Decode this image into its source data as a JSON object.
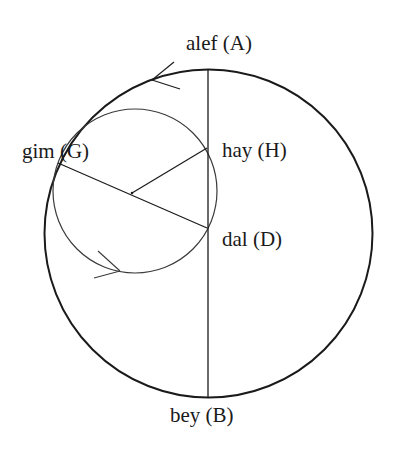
{
  "diagram": {
    "colors": {
      "stroke": "#1a1a1a",
      "inner_stroke": "#3a3a3a",
      "background": "#ffffff"
    },
    "outer_circle": {
      "cx": 208.5,
      "cy": 233.5,
      "r": 164
    },
    "inner_circle": {
      "cx": 135,
      "cy": 191,
      "r": 82
    },
    "points": {
      "A": {
        "name": "alef",
        "label": "alef (A)",
        "x": 208,
        "y": 70
      },
      "B": {
        "name": "bey",
        "label": "bey (B)",
        "x": 208,
        "y": 397
      },
      "G": {
        "name": "gim",
        "label": "gim (G)",
        "x": 58,
        "y": 163
      },
      "D": {
        "name": "dal",
        "label": "dal (D)",
        "x": 207,
        "y": 228
      },
      "H": {
        "name": "hay",
        "label": "hay (H)",
        "x": 207,
        "y": 148
      },
      "center": {
        "x": 132,
        "y": 193
      }
    },
    "segments": [
      "A-B",
      "G-D",
      "center-H"
    ],
    "arrows": [
      {
        "on": "outer_circle",
        "direction": "counterclockwise",
        "tip": [
          152,
          80
        ]
      },
      {
        "on": "inner_circle",
        "direction": "counterclockwise",
        "tip": [
          120,
          271
        ]
      }
    ]
  }
}
